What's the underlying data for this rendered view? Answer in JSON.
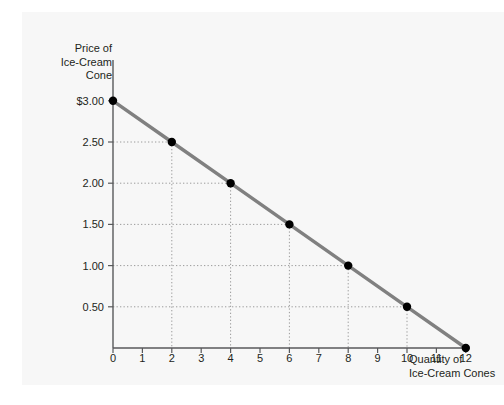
{
  "chart_data": {
    "type": "line",
    "title": "",
    "subtitle": "",
    "xlabel": "Quantity of\nIce-Cream Cones",
    "ylabel": "Price of\nIce-Cream\nCone",
    "xlim": [
      0,
      12
    ],
    "ylim": [
      0,
      3.0
    ],
    "grid": true,
    "grid_style": "dotted",
    "legend": null,
    "x_tick_labels": [
      "0",
      "1",
      "2",
      "3",
      "4",
      "5",
      "6",
      "7",
      "8",
      "9",
      "10",
      "11",
      "12"
    ],
    "x_ticks": [
      0,
      1,
      2,
      3,
      4,
      5,
      6,
      7,
      8,
      9,
      10,
      11,
      12
    ],
    "y_tick_labels": [
      "$3.00",
      "2.50",
      "2.00",
      "1.50",
      "1.00",
      "0.50"
    ],
    "y_ticks": [
      3.0,
      2.5,
      2.0,
      1.5,
      1.0,
      0.5
    ],
    "series": [
      {
        "name": "Demand",
        "color": "#808080",
        "marker_color": "#000000",
        "x": [
          0,
          2,
          4,
          6,
          8,
          10,
          12
        ],
        "values": [
          3.0,
          2.5,
          2.0,
          1.5,
          1.0,
          0.5,
          0.0
        ]
      }
    ],
    "points": [
      {
        "x": 0,
        "y": 3.0
      },
      {
        "x": 2,
        "y": 2.5
      },
      {
        "x": 4,
        "y": 2.0
      },
      {
        "x": 6,
        "y": 1.5
      },
      {
        "x": 8,
        "y": 1.0
      },
      {
        "x": 10,
        "y": 0.5
      },
      {
        "x": 12,
        "y": 0.0
      }
    ]
  },
  "colors": {
    "background": "#ffffff",
    "panel": "#f7f7f7",
    "axis": "#58595b",
    "grid": "#9a9a9a",
    "line": "#808080",
    "marker": "#000000",
    "text": "#231f20"
  },
  "axes": {
    "y_title_lines": [
      "Price of",
      "Ice-Cream",
      "Cone"
    ],
    "x_title_lines": [
      "Quantity of",
      "Ice-Cream Cones"
    ]
  }
}
